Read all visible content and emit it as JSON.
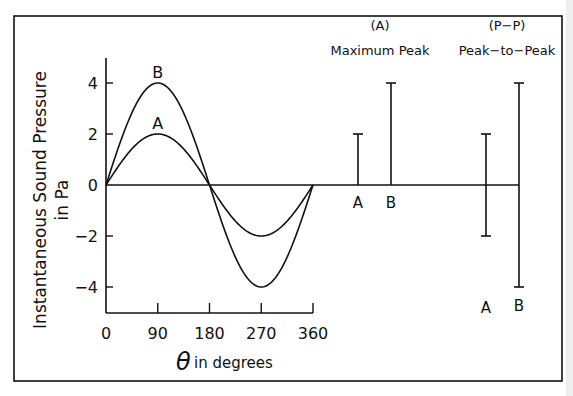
{
  "chart_data": {
    "type": "line",
    "title": "",
    "xlabel_symbol": "θ",
    "xlabel": "in degrees",
    "ylabel_line1": "Instantaneous Sound Pressure",
    "ylabel_line2": "in Pa",
    "xlim": [
      0,
      360
    ],
    "ylim": [
      -5,
      5
    ],
    "x_ticks": [
      0,
      90,
      180,
      270,
      360
    ],
    "x_tick_labels": [
      "0",
      "90",
      "180",
      "270",
      "360"
    ],
    "y_ticks": [
      -4,
      -2,
      0,
      2,
      4
    ],
    "y_tick_labels": [
      "−4",
      "−2",
      "0",
      "2",
      "4"
    ],
    "series": [
      {
        "name": "A",
        "kind": "sine",
        "amplitude": 2,
        "label_x": 90
      },
      {
        "name": "B",
        "kind": "sine",
        "amplitude": 4,
        "label_x": 90
      }
    ],
    "grid": false,
    "annotations": {
      "maximum_peak": {
        "heading_line1": "(A)",
        "heading_line2": "Maximum Peak",
        "bars": [
          {
            "name": "A",
            "low": 0,
            "high": 2
          },
          {
            "name": "B",
            "low": 0,
            "high": 4
          }
        ]
      },
      "peak_to_peak": {
        "heading_line1": "(P−P)",
        "heading_line2": "Peak−to−Peak",
        "bars": [
          {
            "name": "A",
            "low": -2,
            "high": 2
          },
          {
            "name": "B",
            "low": -4,
            "high": 4
          }
        ]
      }
    }
  }
}
